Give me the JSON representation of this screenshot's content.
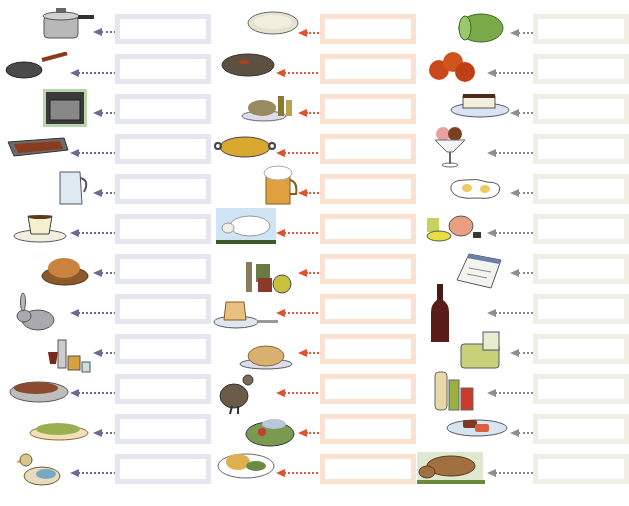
{
  "worksheet": {
    "colors": {
      "column_a_box": "#e6e6f0",
      "column_a_arrow": "#6b6a94",
      "column_b_box": "#fbe2d0",
      "column_b_arrow": "#e05a34",
      "column_c_box": "#efefe6",
      "column_c_arrow": "#8a8a8a"
    },
    "columns": [
      {
        "items": [
          {
            "icon": "pressure-cooker-icon",
            "answer": ""
          },
          {
            "icon": "frying-pan-icon",
            "answer": ""
          },
          {
            "icon": "oven-icon",
            "answer": ""
          },
          {
            "icon": "grill-tray-icon",
            "answer": ""
          },
          {
            "icon": "water-jug-icon",
            "answer": ""
          },
          {
            "icon": "coffee-cup-icon",
            "answer": ""
          },
          {
            "icon": "roast-chicken-icon",
            "answer": ""
          },
          {
            "icon": "rabbit-icon",
            "answer": ""
          },
          {
            "icon": "drinks-glasses-icon",
            "answer": ""
          },
          {
            "icon": "mixed-grill-platter-icon",
            "answer": ""
          },
          {
            "icon": "green-beans-dish-icon",
            "answer": ""
          },
          {
            "icon": "duck-icon",
            "answer": ""
          }
        ]
      },
      {
        "items": [
          {
            "icon": "rice-dish-icon",
            "answer": ""
          },
          {
            "icon": "stew-pot-icon",
            "answer": ""
          },
          {
            "icon": "seafood-rice-platter-icon",
            "answer": ""
          },
          {
            "icon": "paella-pan-icon",
            "answer": ""
          },
          {
            "icon": "beer-mug-icon",
            "answer": ""
          },
          {
            "icon": "sheep-icon",
            "answer": ""
          },
          {
            "icon": "condiment-jars-icon",
            "answer": ""
          },
          {
            "icon": "flan-dessert-icon",
            "answer": ""
          },
          {
            "icon": "roast-turkey-icon",
            "answer": ""
          },
          {
            "icon": "partridge-icon",
            "answer": ""
          },
          {
            "icon": "fish-salad-plate-icon",
            "answer": ""
          },
          {
            "icon": "chicken-salad-plate-icon",
            "answer": ""
          }
        ]
      },
      {
        "items": [
          {
            "icon": "lettuce-icon",
            "answer": ""
          },
          {
            "icon": "tomatoes-icon",
            "answer": ""
          },
          {
            "icon": "cheesecake-icon",
            "answer": ""
          },
          {
            "icon": "ice-cream-sundae-icon",
            "answer": ""
          },
          {
            "icon": "fried-eggs-icon",
            "answer": ""
          },
          {
            "icon": "tea-set-icon",
            "answer": ""
          },
          {
            "icon": "menu-notepad-icon",
            "answer": ""
          },
          {
            "icon": "wine-bottle-icon",
            "answer": ""
          },
          {
            "icon": "cheese-icon",
            "answer": ""
          },
          {
            "icon": "sauces-bottles-icon",
            "answer": ""
          },
          {
            "icon": "steak-plate-icon",
            "answer": ""
          },
          {
            "icon": "bull-icon",
            "answer": ""
          }
        ]
      }
    ]
  }
}
